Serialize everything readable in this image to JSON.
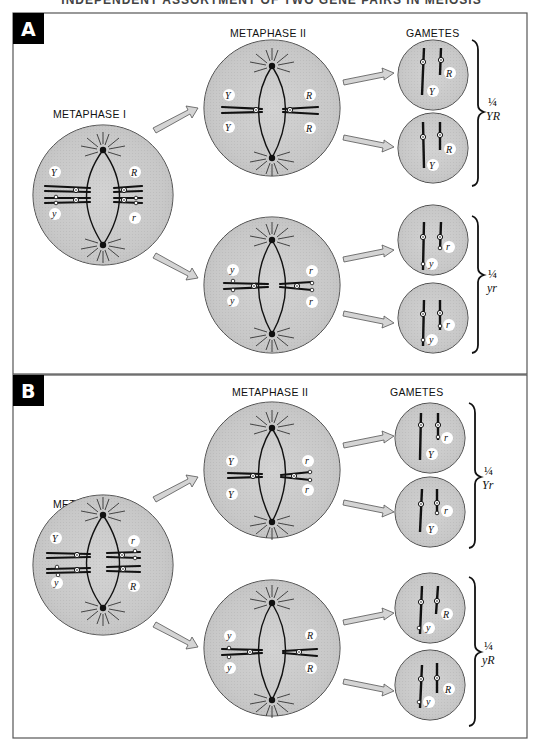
{
  "header": {
    "cut_title": "INDEPENDENT ASSORTMENT OF TWO GENE PAIRS IN MEIOSIS"
  },
  "colors": {
    "cell_fill": "#c9c9c9",
    "cell_stroke": "#333333",
    "chromosome": "#111111",
    "arrow_fill": "#d0d0d0",
    "label_box": "#000000"
  },
  "panels": [
    {
      "letter": "A",
      "metaphase_i_label": "METAPHASE I",
      "metaphase_ii_label": "METAPHASE II",
      "gametes_label": "GAMETES",
      "metaphase_i_alleles": {
        "top_left": "Y",
        "bottom_left": "y",
        "top_right": "R",
        "bottom_right": "r"
      },
      "metaphase_ii_top_alleles": {
        "left_top": "Y",
        "left_bottom": "Y",
        "right_top": "R",
        "right_bottom": "R"
      },
      "metaphase_ii_bottom_alleles": {
        "left_top": "y",
        "left_bottom": "y",
        "right_top": "r",
        "right_bottom": "r"
      },
      "gametes": [
        {
          "allele_1": "Y",
          "allele_2": "R"
        },
        {
          "allele_1": "Y",
          "allele_2": "R"
        },
        {
          "allele_1": "y",
          "allele_2": "r"
        },
        {
          "allele_1": "y",
          "allele_2": "r"
        }
      ],
      "groups": [
        {
          "fraction": "¼",
          "genotype": "YR"
        },
        {
          "fraction": "¼",
          "genotype": "yr"
        }
      ]
    },
    {
      "letter": "B",
      "metaphase_i_label": "METAPHASE I",
      "metaphase_ii_label": "METAPHASE II",
      "gametes_label": "GAMETES",
      "metaphase_i_alleles": {
        "top_left": "Y",
        "bottom_left": "y",
        "top_right": "r",
        "bottom_right": "R"
      },
      "metaphase_ii_top_alleles": {
        "left_top": "Y",
        "left_bottom": "Y",
        "right_top": "r",
        "right_bottom": "r"
      },
      "metaphase_ii_bottom_alleles": {
        "left_top": "y",
        "left_bottom": "y",
        "right_top": "R",
        "right_bottom": "R"
      },
      "gametes": [
        {
          "allele_1": "Y",
          "allele_2": "r"
        },
        {
          "allele_1": "Y",
          "allele_2": "r"
        },
        {
          "allele_1": "y",
          "allele_2": "R"
        },
        {
          "allele_1": "y",
          "allele_2": "R"
        }
      ],
      "groups": [
        {
          "fraction": "¼",
          "genotype": "Yr"
        },
        {
          "fraction": "¼",
          "genotype": "yR"
        }
      ]
    }
  ]
}
